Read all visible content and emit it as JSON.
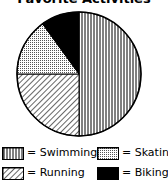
{
  "chart_data": {
    "type": "pie",
    "title": "Favorite Activities",
    "categories": [
      "Swimming",
      "Running",
      "Skating",
      "Biking"
    ],
    "values": [
      50,
      25,
      15,
      10
    ],
    "unit": "percent (estimated from slice angles)",
    "patterns": {
      "Swimming": "vertical-lines",
      "Running": "diagonal-lines",
      "Skating": "dots",
      "Biking": "solid-black"
    },
    "legend_position": "bottom",
    "legend": [
      {
        "label": "= Swimming",
        "pattern": "vertical-lines"
      },
      {
        "label": "= Skating",
        "pattern": "dots"
      },
      {
        "label": "= Running",
        "pattern": "diagonal-lines"
      },
      {
        "label": "= Biking",
        "pattern": "solid-black"
      }
    ]
  },
  "colors": {
    "ink": "#000000",
    "background": "#ffffff"
  }
}
